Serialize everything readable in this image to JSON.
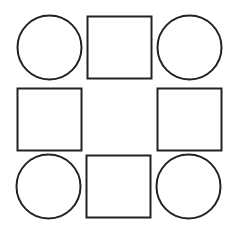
{
  "diagram": {
    "stroke_color": "#222222",
    "background": "#ffffff",
    "shapes": [
      {
        "name": "circle-top-left",
        "type": "circle",
        "cx": 49.5,
        "cy": 47.5,
        "r": 32
      },
      {
        "name": "square-top-center",
        "type": "rect",
        "x": 87.5,
        "y": 16.5,
        "w": 64,
        "h": 62
      },
      {
        "name": "circle-top-right",
        "type": "circle",
        "cx": 189.5,
        "cy": 47.5,
        "r": 32
      },
      {
        "name": "square-middle-left",
        "type": "rect",
        "x": 17.5,
        "y": 88.5,
        "w": 64,
        "h": 62
      },
      {
        "name": "square-middle-right",
        "type": "rect",
        "x": 157.5,
        "y": 88.5,
        "w": 64,
        "h": 62
      },
      {
        "name": "circle-bottom-left",
        "type": "circle",
        "cx": 48.5,
        "cy": 186.5,
        "r": 32
      },
      {
        "name": "square-bottom-center",
        "type": "rect",
        "x": 86.5,
        "y": 155.5,
        "w": 64,
        "h": 62
      },
      {
        "name": "circle-bottom-right",
        "type": "circle",
        "cx": 188.5,
        "cy": 186.5,
        "r": 32
      }
    ]
  }
}
